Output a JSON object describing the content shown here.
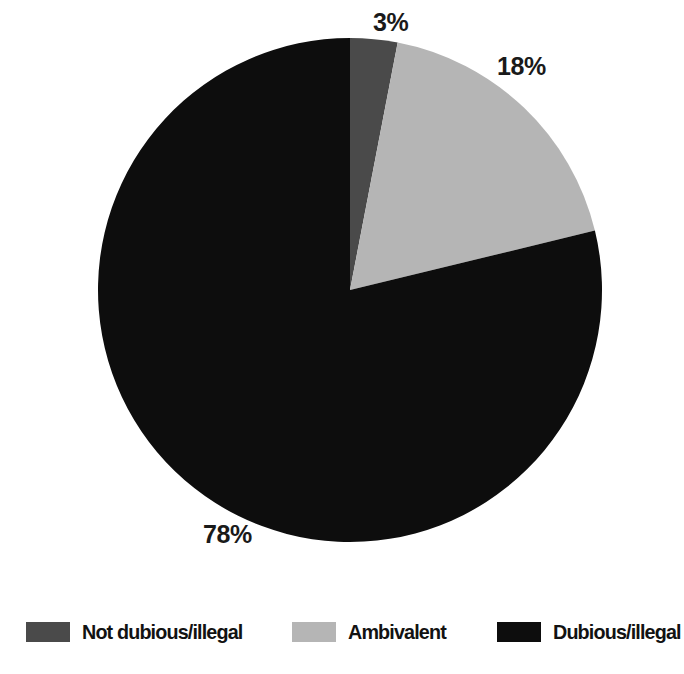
{
  "chart_data": {
    "type": "pie",
    "title": "",
    "subtitle": "",
    "xlabel": "",
    "ylabel": "",
    "grid": false,
    "legend_position": "bottom",
    "start_angle_deg": 0,
    "direction": "clockwise",
    "unit": "%",
    "categories": [
      "Not dubious/illegal",
      "Ambivalent",
      "Dubious/illegal"
    ],
    "values": [
      3,
      18,
      78
    ],
    "data_labels": [
      "3%",
      "18%",
      "78%"
    ],
    "colors": [
      "#4a4a4a",
      "#b5b5b5",
      "#0d0d0d"
    ],
    "slices": [
      {
        "label": "Not dubious/illegal",
        "value": 3,
        "display": "3%",
        "color": "#4a4a4a"
      },
      {
        "label": "Ambivalent",
        "value": 18,
        "display": "18%",
        "color": "#b5b5b5"
      },
      {
        "label": "Dubious/illegal",
        "value": 78,
        "display": "78%",
        "color": "#0d0d0d"
      }
    ]
  },
  "legend": {
    "items": [
      {
        "label": "Not dubious/illegal",
        "color": "#4a4a4a"
      },
      {
        "label": "Ambivalent",
        "color": "#b5b5b5"
      },
      {
        "label": "Dubious/illegal",
        "color": "#0d0d0d"
      }
    ]
  },
  "labels": {
    "slice_0": "3%",
    "slice_1": "18%",
    "slice_2": "78%"
  },
  "geometry": {
    "center_x": 350,
    "center_y": 290,
    "radius": 252
  }
}
